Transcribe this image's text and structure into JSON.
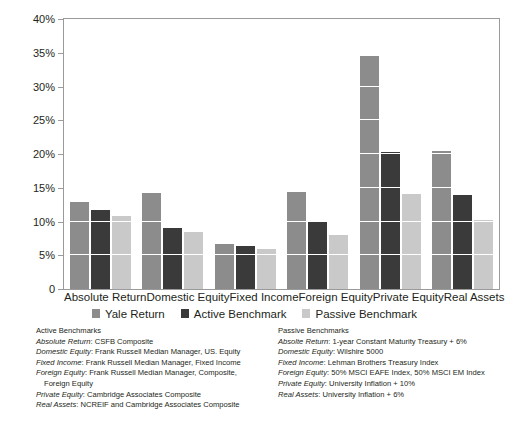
{
  "chart_data": {
    "type": "bar",
    "title": "",
    "subtitle": "",
    "xlabel": "",
    "ylabel": "",
    "ylim": [
      0,
      40
    ],
    "yticks": [
      "0",
      "5%",
      "10%",
      "15%",
      "20%",
      "25%",
      "30%",
      "35%",
      "40%"
    ],
    "ytick_values": [
      0,
      5,
      10,
      15,
      20,
      25,
      30,
      35,
      40
    ],
    "grid": true,
    "legend_position": "bottom",
    "categories": [
      "Absolute Return",
      "Domestic Equity",
      "Fixed Income",
      "Foreign Equity",
      "Private Equity",
      "Real Assets"
    ],
    "series": [
      {
        "name": "Yale Return",
        "color": "#8c8c8c",
        "values": [
          12.9,
          14.2,
          6.6,
          14.4,
          34.5,
          20.4
        ]
      },
      {
        "name": "Active Benchmark",
        "color": "#3a3a3a",
        "values": [
          11.7,
          9.0,
          6.4,
          9.9,
          20.3,
          13.9
        ]
      },
      {
        "name": "Passive Benchmark",
        "color": "#c9c9c9",
        "values": [
          10.8,
          8.5,
          6.0,
          8.0,
          14.1,
          10.2
        ]
      }
    ]
  },
  "legend": {
    "items": [
      {
        "label": "Yale Return"
      },
      {
        "label": "Active Benchmark"
      },
      {
        "label": "Passive Benchmark"
      }
    ]
  },
  "footnotes": {
    "active": {
      "heading": "Active Benchmarks",
      "lines": [
        {
          "lead": "Absolute Return",
          "text": ": CSFB Composite",
          "continuation": ""
        },
        {
          "lead": "Domestic Equity",
          "text": ": Frank Russell Median Manager, US. Equity",
          "continuation": ""
        },
        {
          "lead": "Fixed Income",
          "text": ": Frank Russell Median Manager, Fixed Income",
          "continuation": ""
        },
        {
          "lead": "Foreign Equity",
          "text": ": Frank Russell Median Manager, Composite,",
          "continuation": "Foreign Equity"
        },
        {
          "lead": "Private Equity",
          "text": ": Cambridge Associates Composite",
          "continuation": ""
        },
        {
          "lead": "Real Assets",
          "text": ": NCREIF and Cambridge Associates Composite",
          "continuation": ""
        }
      ]
    },
    "passive": {
      "heading": "Passive Benchmarks",
      "lines": [
        {
          "lead": "Absolte Return",
          "text": ": 1-year Constant Maturity Treasury + 6%",
          "continuation": ""
        },
        {
          "lead": "Domestic Equity",
          "text": ": Wilshire 5000",
          "continuation": ""
        },
        {
          "lead": "Fixed Income",
          "text": ": Lehman Brothers Treasury Index",
          "continuation": ""
        },
        {
          "lead": "Foreign Equity",
          "text": ": 50% MSCI EAFE Index, 50% MSCI EM Index",
          "continuation": ""
        },
        {
          "lead": "Private Equity",
          "text": ": University Inflation + 10%",
          "continuation": ""
        },
        {
          "lead": "Real Assets",
          "text": ": University Inflation + 6%",
          "continuation": ""
        }
      ]
    }
  }
}
